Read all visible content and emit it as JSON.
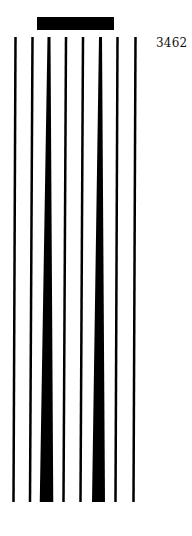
{
  "figure": {
    "label": "3462",
    "ink_color": "#000000",
    "background": "#ffffff",
    "top_bar": {
      "x": 37,
      "y": 17,
      "width": 77,
      "height": 13
    },
    "lines": [
      {
        "kind": "line",
        "top_x": 15.5,
        "bottom_x": 13.5,
        "top_w": 2.5,
        "bottom_w": 2.5
      },
      {
        "kind": "line",
        "top_x": 32.5,
        "bottom_x": 30,
        "top_w": 2.5,
        "bottom_w": 2.5
      },
      {
        "kind": "wedge",
        "top_x": 49,
        "bottom_x": 46.5,
        "top_w": 3,
        "bottom_w": 13.5
      },
      {
        "kind": "line",
        "top_x": 66,
        "bottom_x": 63.5,
        "top_w": 2.5,
        "bottom_w": 2.5
      },
      {
        "kind": "line",
        "top_x": 83,
        "bottom_x": 80.5,
        "top_w": 2.5,
        "bottom_w": 2.5
      },
      {
        "kind": "wedge",
        "top_x": 100.5,
        "bottom_x": 98.5,
        "top_w": 3,
        "bottom_w": 13
      },
      {
        "kind": "line",
        "top_x": 117.5,
        "bottom_x": 115.5,
        "top_w": 2.5,
        "bottom_w": 2.5
      },
      {
        "kind": "line",
        "top_x": 135.5,
        "bottom_x": 133.5,
        "top_w": 2.5,
        "bottom_w": 2.5
      }
    ],
    "lines_top_y": 37,
    "lines_bottom_y": 502
  }
}
